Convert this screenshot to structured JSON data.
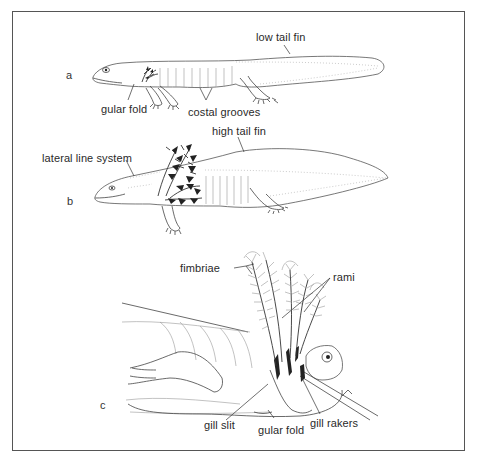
{
  "figure": {
    "panels": [
      {
        "id": "a",
        "label": "a",
        "annotations": {
          "low_tail_fin": "low tail fin",
          "gular_fold": "gular fold",
          "costal_grooves": "costal grooves"
        }
      },
      {
        "id": "b",
        "label": "b",
        "annotations": {
          "high_tail_fin": "high tail fin",
          "lateral_line_system": "lateral line system"
        }
      },
      {
        "id": "c",
        "label": "c",
        "annotations": {
          "fimbriae": "fimbriae",
          "rami": "rami",
          "gill_slit": "gill slit",
          "gular_fold": "gular fold",
          "gill_rakers": "gill rakers"
        }
      }
    ]
  }
}
